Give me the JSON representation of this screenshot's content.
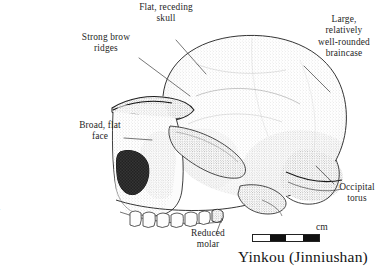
{
  "figure": {
    "caption": "Yinkou (Jinniushan)",
    "technique": "stippled pen-and-ink line drawing",
    "orientation": "left-facing lateral (side) view",
    "ink_color": "#1a1a1a",
    "background_color": "#ffffff"
  },
  "annotations": [
    {
      "id": "flat-receding-skull",
      "text": "Flat, receding\nskull"
    },
    {
      "id": "strong-brow-ridges",
      "text": "Strong brow\nridges"
    },
    {
      "id": "broad-flat-face",
      "text": "Broad, flat\nface"
    },
    {
      "id": "large-braincase",
      "text": "Large,\nrelatively\nwell-rounded\nbraincase"
    },
    {
      "id": "occipital-torus",
      "text": "Occipital\ntorus"
    },
    {
      "id": "reduced-molar",
      "text": "Reduced\nmolar"
    }
  ],
  "scale": {
    "unit": "cm",
    "segments": [
      "off",
      "on",
      "off",
      "on"
    ]
  },
  "body_text": "cs of ar-\nin East Asia\nhis figure\nns from Yin-\nroximately"
}
